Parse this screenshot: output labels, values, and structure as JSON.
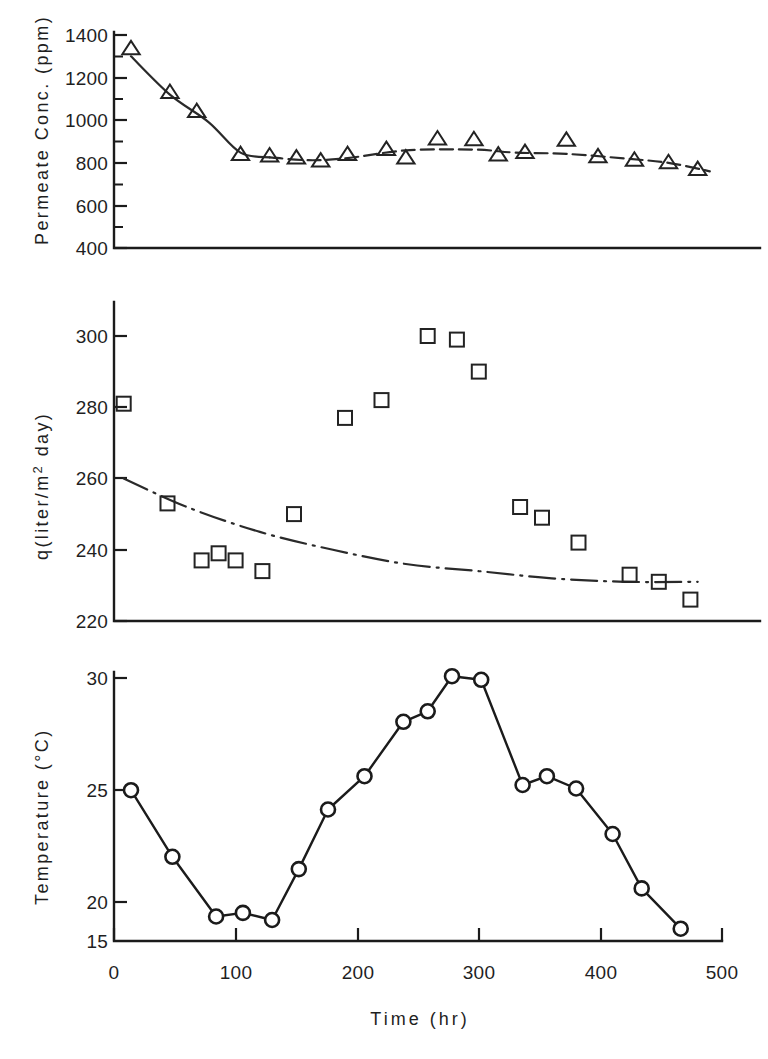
{
  "figure": {
    "background_color": "#ffffff",
    "ink_color": "#1b1b1b",
    "panel_count": 3
  },
  "xaxis": {
    "label": "Time (hr)",
    "ticks": [
      "0",
      "100",
      "200",
      "300",
      "400",
      "500"
    ],
    "min": 0,
    "max": 500
  },
  "panels": {
    "top": {
      "ylabel": "Permeate Conc. (ppm)",
      "yticks": [
        "1400",
        "1200",
        "1000",
        "800",
        "600",
        "400"
      ]
    },
    "middle": {
      "ylabel_pre": "q(liter/m",
      "ylabel_sup": "2",
      "ylabel_post": " day)",
      "yticks": [
        "300",
        "280",
        "260",
        "240",
        "220"
      ]
    },
    "bottom": {
      "ylabel_pre": "Temperature  (",
      "ylabel_deg": "°",
      "ylabel_post": "C)",
      "yticks": [
        "30",
        "25",
        "20",
        "15"
      ]
    }
  },
  "chart_data": [
    {
      "type": "scatter",
      "panel": "top",
      "title": "",
      "xlabel": "Time (hr)",
      "ylabel": "Permeate Conc. (ppm)",
      "xlim": [
        0,
        500
      ],
      "ylim": [
        400,
        1400
      ],
      "grid": false,
      "legend": "none",
      "marker": "open-triangle",
      "series": [
        {
          "name": "Permeate concentration",
          "points": [
            [
              14,
              1335
            ],
            [
              46,
              1130
            ],
            [
              68,
              1040
            ],
            [
              104,
              838
            ],
            [
              128,
              832
            ],
            [
              150,
              822
            ],
            [
              170,
              808
            ],
            [
              192,
              838
            ],
            [
              224,
              862
            ],
            [
              240,
              822
            ],
            [
              266,
              912
            ],
            [
              296,
              908
            ],
            [
              316,
              836
            ],
            [
              338,
              848
            ],
            [
              372,
              905
            ],
            [
              398,
              828
            ],
            [
              428,
              812
            ],
            [
              456,
              800
            ],
            [
              480,
              768
            ]
          ]
        }
      ],
      "trend_line": {
        "style": "solid-then-dashed",
        "points": [
          [
            14,
            1300
          ],
          [
            46,
            1120
          ],
          [
            78,
            990
          ],
          [
            104,
            848
          ],
          [
            128,
            826
          ],
          [
            160,
            812
          ],
          [
            192,
            822
          ],
          [
            240,
            858
          ],
          [
            296,
            862
          ],
          [
            330,
            848
          ],
          [
            372,
            842
          ],
          [
            420,
            820
          ],
          [
            456,
            800
          ],
          [
            490,
            760
          ]
        ]
      }
    },
    {
      "type": "scatter",
      "panel": "middle",
      "title": "",
      "xlabel": "Time (hr)",
      "ylabel": "q(liter/m2 day)",
      "xlim": [
        0,
        500
      ],
      "ylim": [
        220,
        300
      ],
      "grid": false,
      "legend": "none",
      "marker": "open-square",
      "series": [
        {
          "name": "Permeate flux",
          "points": [
            [
              8,
              281
            ],
            [
              44,
              253
            ],
            [
              72,
              237
            ],
            [
              86,
              239
            ],
            [
              100,
              237
            ],
            [
              122,
              234
            ],
            [
              148,
              250
            ],
            [
              190,
              277
            ],
            [
              220,
              282
            ],
            [
              258,
              300
            ],
            [
              282,
              299
            ],
            [
              300,
              290
            ],
            [
              334,
              252
            ],
            [
              352,
              249
            ],
            [
              382,
              242
            ],
            [
              424,
              233
            ],
            [
              448,
              231
            ],
            [
              474,
              226
            ]
          ]
        }
      ],
      "trend_line": {
        "style": "dash-dot",
        "points": [
          [
            8,
            260
          ],
          [
            60,
            252
          ],
          [
            120,
            245
          ],
          [
            180,
            240
          ],
          [
            240,
            236
          ],
          [
            300,
            234
          ],
          [
            360,
            232
          ],
          [
            420,
            231
          ],
          [
            480,
            231
          ]
        ]
      }
    },
    {
      "type": "line",
      "panel": "bottom",
      "title": "",
      "xlabel": "Time (hr)",
      "ylabel": "Temperature (°C)",
      "xlim": [
        0,
        500
      ],
      "ylim": [
        15,
        30
      ],
      "grid": false,
      "legend": "none",
      "marker": "open-circle",
      "series": [
        {
          "name": "Feed temperature",
          "points": [
            [
              14,
              23.6
            ],
            [
              48,
              19.8
            ],
            [
              84,
              16.4
            ],
            [
              106,
              16.6
            ],
            [
              130,
              16.2
            ],
            [
              152,
              19.1
            ],
            [
              176,
              22.5
            ],
            [
              206,
              24.4
            ],
            [
              238,
              27.5
            ],
            [
              258,
              28.1
            ],
            [
              278,
              30.1
            ],
            [
              302,
              29.9
            ],
            [
              336,
              23.9
            ],
            [
              356,
              24.4
            ],
            [
              380,
              23.7
            ],
            [
              410,
              21.1
            ],
            [
              434,
              18.0
            ],
            [
              466,
              15.7
            ]
          ]
        }
      ]
    }
  ]
}
